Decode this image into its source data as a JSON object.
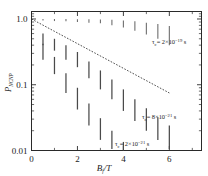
{
  "chart_data": {
    "type": "scatter",
    "title": "",
    "xlabel": "Bf/T",
    "xlabel_main": "B",
    "xlabel_sub": "f",
    "xlabel_denom": "T",
    "ylabel_main": "P",
    "ylabel_sub": "NCNP",
    "yscale": "log",
    "xlim": [
      0,
      7.4
    ],
    "ylim": [
      0.01,
      1.3
    ],
    "xticks": [
      0,
      2,
      4,
      6
    ],
    "xticklabels": [
      "0",
      "2",
      "4",
      "6"
    ],
    "xminorticks": [
      1,
      3,
      5,
      7
    ],
    "yticks": [
      1.0,
      0.1,
      0.01
    ],
    "yticklabels": [
      "1.0",
      "0.1",
      "0.01"
    ],
    "grid": false,
    "legend_position": "inline-annotations",
    "series": [
      {
        "name": "tau_c = 2e-19 s",
        "tau_value": "2×10",
        "tau_exp": "−19",
        "label": "τc= 2×10⁻¹⁹ s",
        "x": [
          0.5,
          1.0,
          1.5,
          2.0,
          2.5,
          3.0,
          3.5,
          4.0,
          4.5,
          5.0,
          5.5,
          6.0
        ],
        "y_lo": [
          0.95,
          0.93,
          0.92,
          0.9,
          0.88,
          0.86,
          0.8,
          0.74,
          0.66,
          0.58,
          0.5,
          0.4
        ],
        "y_hi": [
          1.0,
          1.0,
          1.0,
          0.99,
          0.99,
          0.98,
          0.97,
          0.95,
          0.92,
          0.88,
          0.84,
          0.78
        ]
      },
      {
        "name": "tau_c = 8e-21 s",
        "tau_value": "8×10",
        "tau_exp": "−21",
        "label": "τc= 8×10⁻²¹ s",
        "x": [
          0.5,
          1.0,
          1.5,
          2.0,
          2.5,
          3.0,
          3.5,
          4.0,
          4.5,
          5.0,
          5.5,
          6.0
        ],
        "y_lo": [
          0.4,
          0.33,
          0.24,
          0.185,
          0.125,
          0.085,
          0.06,
          0.04,
          0.028,
          0.02,
          0.0145,
          0.0105
        ],
        "y_hi": [
          0.6,
          0.5,
          0.4,
          0.315,
          0.225,
          0.165,
          0.12,
          0.085,
          0.06,
          0.044,
          0.032,
          0.024
        ]
      },
      {
        "name": "tau_c = 2e-21 s",
        "tau_value": "2×10",
        "tau_exp": "−21",
        "label": "τc= 2×10⁻²¹ s",
        "x": [
          0.5,
          1.0,
          1.5,
          2.0,
          2.5,
          3.0,
          3.5,
          4.0
        ],
        "y_lo": [
          0.24,
          0.145,
          0.075,
          0.042,
          0.024,
          0.0145,
          0.0105,
          0.01
        ],
        "y_hi": [
          0.42,
          0.265,
          0.15,
          0.09,
          0.052,
          0.031,
          0.02,
          0.0135
        ]
      }
    ],
    "trendline": {
      "name": "exponential-fit",
      "x": [
        0.0,
        6.0
      ],
      "y": [
        1.0,
        0.075
      ],
      "style": "dashed"
    },
    "annotations": [
      {
        "id": "ann-tau-1",
        "text_tau": "τ",
        "text_sub": "c",
        "text_eq": "= 2×10",
        "text_sup": "−19",
        "text_unit": " s",
        "x_px": 152,
        "y_px": 44
      },
      {
        "id": "ann-tau-2",
        "text_tau": "τ",
        "text_sub": "c",
        "text_eq": "= 8×10",
        "text_sup": "−21",
        "text_unit": " s",
        "x_px": 142,
        "y_px": 119
      },
      {
        "id": "ann-tau-3",
        "text_tau": "τ",
        "text_sub": "c",
        "text_eq": "= 2×10",
        "text_sup": "−21",
        "text_unit": " s",
        "x_px": 115,
        "y_px": 146
      }
    ]
  },
  "colors": {
    "axis": "#2a2a2a",
    "errorbar": "#4a4a4a",
    "errorbar_light": "#6e6e6e",
    "trend": "#3a3a3a",
    "background": "#ffffff"
  }
}
